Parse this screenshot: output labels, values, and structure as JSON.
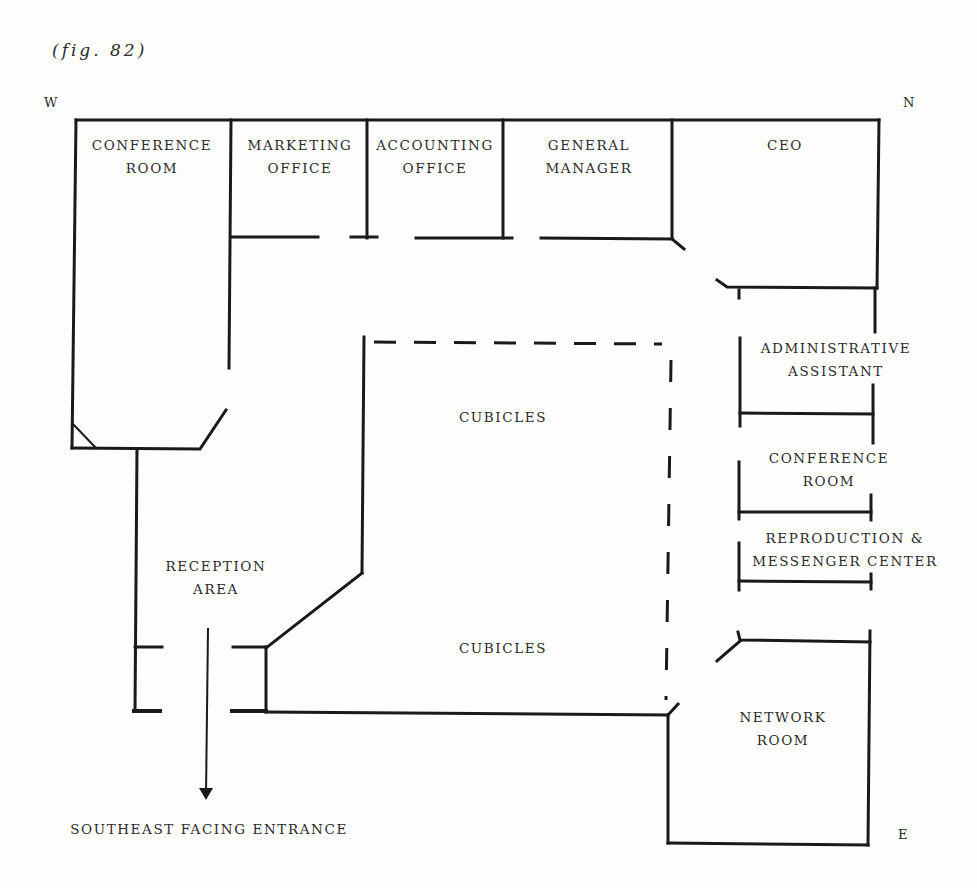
{
  "figure": {
    "caption": "(fig. 82)"
  },
  "compass": {
    "west": "W",
    "north": "N",
    "east": "E"
  },
  "rooms": {
    "conference_room_west": {
      "line1": "CONFERENCE",
      "line2": "ROOM"
    },
    "marketing_office": {
      "line1": "MARKETING",
      "line2": "OFFICE"
    },
    "accounting_office": {
      "line1": "ACCOUNTING",
      "line2": "OFFICE"
    },
    "general_manager": {
      "line1": "GENERAL",
      "line2": "MANAGER"
    },
    "ceo": {
      "line1": "CEO"
    },
    "administrative_assistant": {
      "line1": "ADMINISTRATIVE",
      "line2": "ASSISTANT"
    },
    "conference_room_east": {
      "line1": "CONFERENCE",
      "line2": "ROOM"
    },
    "reproduction_center": {
      "line1": "REPRODUCTION &",
      "line2": "MESSENGER CENTER"
    },
    "cubicles_upper": {
      "line1": "CUBICLES"
    },
    "cubicles_lower": {
      "line1": "CUBICLES"
    },
    "reception_area": {
      "line1": "RECEPTION",
      "line2": "AREA"
    },
    "network_room": {
      "line1": "NETWORK",
      "line2": "ROOM"
    }
  },
  "entrance": {
    "label": "SOUTHEAST FACING ENTRANCE"
  },
  "colors": {
    "ink": "#1a1a1a",
    "paper": "#fdfdfb"
  }
}
